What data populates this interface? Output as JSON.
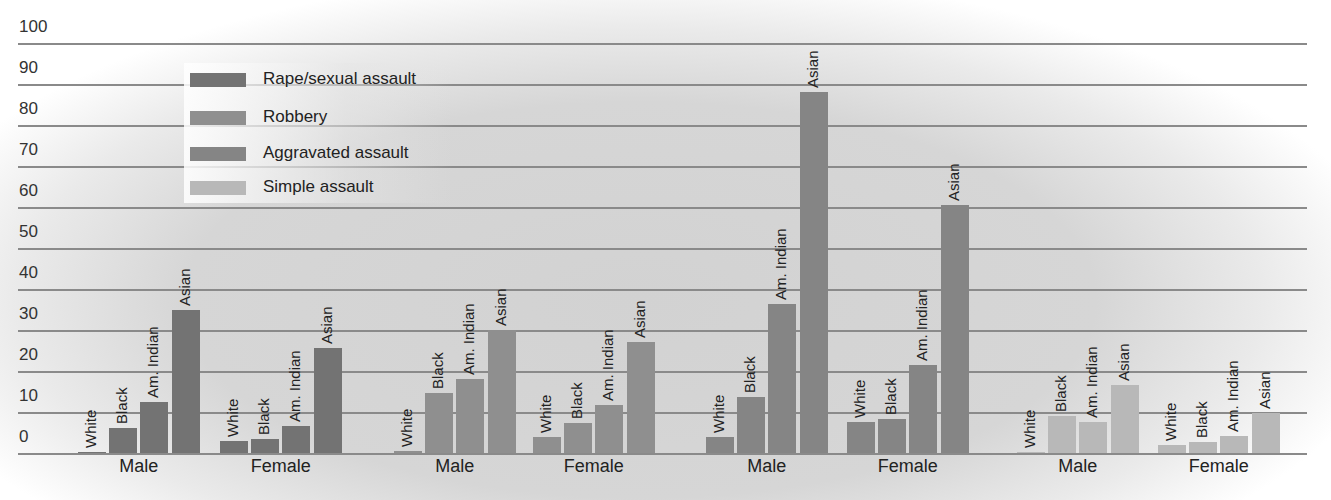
{
  "chart_data": {
    "type": "bar",
    "title": "",
    "xlabel": "",
    "ylabel": "",
    "ylim": [
      0,
      100
    ],
    "yticks": [
      0,
      10,
      20,
      30,
      40,
      50,
      60,
      70,
      80,
      90,
      100
    ],
    "grid": true,
    "legend_position": "upper-left",
    "legend": [
      "Rape/sexual assault",
      "Robbery",
      "Aggravated assault",
      "Simple assault"
    ],
    "colors": {
      "Rape/sexual assault": "#737373",
      "Robbery": "#8f8f8f",
      "Aggravated assault": "#858585",
      "Simple assault": "#b8b8b8"
    },
    "categories": [
      "White",
      "Black",
      "Am. Indian",
      "Asian"
    ],
    "groups": [
      "Male",
      "Female"
    ],
    "series": [
      {
        "name": "Rape/sexual assault",
        "sex": "Male",
        "values": [
          0.3,
          6,
          12.5,
          35
        ]
      },
      {
        "name": "Rape/sexual assault",
        "sex": "Female",
        "values": [
          3,
          3.3,
          6.7,
          25.5
        ]
      },
      {
        "name": "Robbery",
        "sex": "Male",
        "values": [
          0.5,
          14.6,
          18,
          30
        ]
      },
      {
        "name": "Robbery",
        "sex": "Female",
        "values": [
          4,
          7.4,
          11.8,
          27
        ]
      },
      {
        "name": "Aggravated assault",
        "sex": "Male",
        "values": [
          4,
          13.6,
          36.3,
          88
        ]
      },
      {
        "name": "Aggravated assault",
        "sex": "Female",
        "values": [
          7.6,
          8.3,
          21.4,
          60.5
        ]
      },
      {
        "name": "Simple assault",
        "sex": "Male",
        "values": [
          0.3,
          9,
          7.5,
          16.6
        ]
      },
      {
        "name": "Simple assault",
        "sex": "Female",
        "values": [
          2,
          2.6,
          4.1,
          9.7
        ]
      }
    ]
  },
  "axis": {
    "ticks": [
      "0",
      "10",
      "20",
      "30",
      "40",
      "50",
      "60",
      "70",
      "80",
      "90",
      "100"
    ]
  },
  "legend": {
    "items": [
      {
        "label": "Rape/sexual assault",
        "color": "#737373"
      },
      {
        "label": "Robbery",
        "color": "#8f8f8f"
      },
      {
        "label": "Aggravated assault",
        "color": "#858585"
      },
      {
        "label": "Simple assault",
        "color": "#b8b8b8"
      }
    ]
  },
  "group_labels": {
    "male": "Male",
    "female": "Female"
  }
}
